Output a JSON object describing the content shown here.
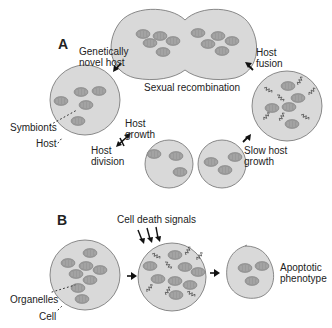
{
  "panel_a": {
    "letter": "A",
    "labels": {
      "genetically_novel_host": [
        "Genetically",
        "novel host"
      ],
      "sexual_recombination": "Sexual recombination",
      "host_fusion": [
        "Host",
        "fusion"
      ],
      "symbionts": "Symbionts",
      "host": "Host",
      "host_growth": [
        "Host",
        "growth"
      ],
      "host_division": [
        "Host",
        "division"
      ],
      "slow_host_growth": [
        "Slow host",
        "growth"
      ]
    }
  },
  "panel_b": {
    "letter": "B",
    "labels": {
      "cell_death_signals": "Cell death signals",
      "organelles": "Organelles",
      "cell": "Cell",
      "apoptotic_phenotype": [
        "Apoptotic",
        "phenotype"
      ]
    }
  },
  "colors": {
    "cell_fill": "#d9d9d9",
    "organelle_fill": "#9a9a9a",
    "text": "#222222"
  }
}
